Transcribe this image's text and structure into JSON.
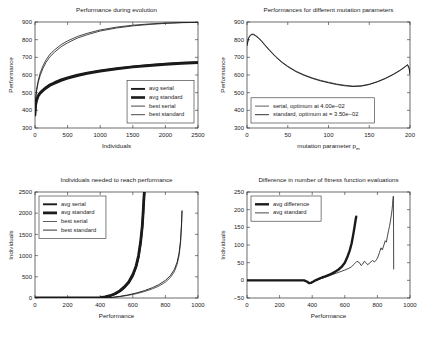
{
  "figure": {
    "background": "#ffffff",
    "line_color": "#1a1a1a",
    "axis_color": "#2b2b2b"
  },
  "chart_data": [
    {
      "id": "performance-during-evolution",
      "type": "line",
      "title": "Performance during evolution",
      "xlabel": "Individuals",
      "ylabel": "Performance",
      "xlim": [
        0,
        2500
      ],
      "ylim": [
        300,
        900
      ],
      "xticks": [
        0,
        500,
        1000,
        1500,
        2000,
        2500
      ],
      "yticks": [
        300,
        400,
        500,
        600,
        700,
        800,
        900
      ],
      "grid": false,
      "legend_position": "lower right",
      "series": [
        {
          "name": "avg serial",
          "width": 1.9,
          "x": [
            0,
            10,
            25,
            50,
            80,
            120,
            170,
            230,
            300,
            400,
            500,
            650,
            800,
            1000,
            1250,
            1500,
            1750,
            2000,
            2250,
            2500
          ],
          "values": [
            375,
            432,
            462,
            487,
            503,
            517,
            532,
            547,
            559,
            575,
            587,
            602,
            613,
            626,
            639,
            649,
            657,
            664,
            669,
            673
          ]
        },
        {
          "name": "avg standard",
          "width": 2.6,
          "x": [
            0,
            10,
            25,
            50,
            80,
            120,
            170,
            230,
            300,
            400,
            500,
            650,
            800,
            1000,
            1250,
            1500,
            1750,
            2000,
            2250,
            2500
          ],
          "values": [
            372,
            427,
            456,
            481,
            497,
            511,
            526,
            541,
            553,
            569,
            581,
            596,
            608,
            621,
            634,
            645,
            653,
            660,
            666,
            670
          ]
        },
        {
          "name": "best serial",
          "width": 0.8,
          "x": [
            0,
            10,
            25,
            50,
            80,
            120,
            170,
            230,
            300,
            400,
            500,
            650,
            800,
            1000,
            1250,
            1500,
            1750,
            2000,
            2250,
            2500
          ],
          "values": [
            380,
            470,
            520,
            570,
            612,
            650,
            686,
            718,
            742,
            772,
            793,
            818,
            836,
            855,
            871,
            882,
            889,
            894,
            897,
            899
          ]
        },
        {
          "name": "best standard",
          "width": 0.8,
          "x": [
            0,
            10,
            25,
            50,
            80,
            120,
            170,
            230,
            300,
            400,
            500,
            650,
            800,
            1000,
            1250,
            1500,
            1750,
            2000,
            2250,
            2500
          ],
          "values": [
            378,
            462,
            510,
            558,
            598,
            636,
            672,
            704,
            729,
            760,
            782,
            809,
            828,
            849,
            866,
            878,
            886,
            892,
            896,
            898
          ]
        }
      ]
    },
    {
      "id": "performances-mutation-parameters",
      "type": "line",
      "title": "Performances for different mutation parameters",
      "xlabel": "mutation parameter p",
      "xlabel_sub": "m",
      "ylabel": "Performance",
      "xlim": [
        0,
        200
      ],
      "ylim": [
        300,
        900
      ],
      "xticks": [
        0,
        50,
        100,
        150,
        200
      ],
      "yticks": [
        300,
        400,
        500,
        600,
        700,
        800,
        900
      ],
      "grid": false,
      "legend_position": "lower left",
      "series": [
        {
          "name": "serial, optimum at 4.00e-02",
          "width": 0.7,
          "x": [
            0,
            2,
            4,
            6,
            8,
            10,
            14,
            18,
            22,
            28,
            35,
            42,
            50,
            60,
            70,
            80,
            90,
            100,
            110,
            120,
            130,
            140,
            150,
            160,
            170,
            180,
            188,
            194,
            197,
            199,
            200
          ],
          "values": [
            770,
            812,
            826,
            832,
            831,
            826,
            812,
            793,
            771,
            740,
            706,
            677,
            650,
            622,
            601,
            584,
            570,
            559,
            549,
            542,
            537,
            539,
            548,
            563,
            582,
            606,
            628,
            648,
            659,
            640,
            608
          ]
        },
        {
          "name": "standard, optimum at = 3.50e-02",
          "width": 0.9,
          "x": [
            0,
            2,
            4,
            6,
            8,
            10,
            14,
            18,
            22,
            28,
            35,
            42,
            50,
            60,
            70,
            80,
            90,
            100,
            110,
            120,
            130,
            140,
            150,
            160,
            170,
            180,
            188,
            194,
            197,
            199,
            200
          ],
          "values": [
            766,
            808,
            823,
            829,
            828,
            823,
            809,
            790,
            768,
            737,
            703,
            674,
            647,
            619,
            598,
            581,
            567,
            556,
            546,
            539,
            535,
            537,
            546,
            561,
            580,
            604,
            626,
            646,
            657,
            636,
            604
          ]
        }
      ]
    },
    {
      "id": "individuals-needed-to-reach-performance",
      "type": "line",
      "title": "Individuals needed to reach performance",
      "xlabel": "Performance",
      "ylabel": "Individuals",
      "xlim": [
        0,
        1000
      ],
      "ylim": [
        0,
        2500
      ],
      "xticks": [
        0,
        200,
        400,
        600,
        800,
        1000
      ],
      "yticks": [
        0,
        500,
        1000,
        1500,
        2000,
        2500
      ],
      "grid": false,
      "legend_position": "upper left",
      "series": [
        {
          "name": "avg serial",
          "width": 1.9,
          "x": [
            0,
            200,
            360,
            400,
            430,
            460,
            490,
            520,
            550,
            575,
            600,
            620,
            635,
            648,
            658,
            664,
            668,
            671
          ],
          "values": [
            0,
            0,
            2,
            8,
            22,
            48,
            90,
            155,
            250,
            355,
            520,
            720,
            960,
            1290,
            1660,
            2020,
            2320,
            2500
          ]
        },
        {
          "name": "avg standard",
          "width": 2.8,
          "x": [
            0,
            200,
            360,
            400,
            430,
            460,
            490,
            520,
            550,
            575,
            600,
            620,
            635,
            648,
            658,
            664,
            668,
            671
          ],
          "values": [
            0,
            0,
            2,
            9,
            25,
            54,
            99,
            168,
            268,
            378,
            548,
            752,
            995,
            1325,
            1695,
            2055,
            2350,
            2500
          ]
        },
        {
          "name": "best serial",
          "width": 0.7,
          "x": [
            0,
            200,
            400,
            440,
            480,
            520,
            570,
            620,
            670,
            720,
            760,
            800,
            830,
            855,
            872,
            884,
            893,
            899,
            902
          ],
          "values": [
            0,
            0,
            1,
            6,
            16,
            32,
            62,
            100,
            150,
            215,
            280,
            375,
            480,
            620,
            790,
            1000,
            1300,
            1700,
            2040
          ]
        },
        {
          "name": "best standard",
          "width": 0.9,
          "x": [
            0,
            200,
            400,
            440,
            480,
            520,
            570,
            620,
            670,
            720,
            760,
            800,
            830,
            855,
            872,
            884,
            893,
            899,
            902
          ],
          "values": [
            0,
            0,
            1,
            7,
            19,
            38,
            72,
            115,
            172,
            243,
            315,
            415,
            525,
            672,
            845,
            1060,
            1360,
            1760,
            2060
          ]
        }
      ]
    },
    {
      "id": "difference-in-fitness-function-evaluations",
      "type": "line",
      "title": "Difference in number of fitness function evaluations",
      "xlabel": "Performance",
      "ylabel": "Individuals",
      "xlim": [
        0,
        1000
      ],
      "ylim": [
        -50,
        250
      ],
      "xticks": [
        0,
        200,
        400,
        600,
        800,
        1000
      ],
      "yticks": [
        -50,
        0,
        50,
        100,
        150,
        200,
        250
      ],
      "grid": false,
      "legend_position": "upper left",
      "series": [
        {
          "name": "avg difference",
          "width": 2.4,
          "x": [
            0,
            200,
            350,
            370,
            380,
            392,
            405,
            420,
            440,
            460,
            480,
            500,
            520,
            540,
            560,
            580,
            600,
            615,
            630,
            642,
            652,
            660,
            666,
            670
          ],
          "values": [
            0,
            0,
            0,
            -4,
            -8,
            -7,
            -4,
            0,
            4,
            8,
            11,
            15,
            19,
            24,
            30,
            38,
            50,
            65,
            84,
            105,
            130,
            152,
            170,
            180
          ]
        },
        {
          "name": "avg standard",
          "width": 0.8,
          "x": [
            0,
            200,
            350,
            370,
            385,
            400,
            420,
            450,
            480,
            510,
            540,
            570,
            600,
            620,
            640,
            660,
            675,
            690,
            700,
            710,
            720,
            730,
            740,
            755,
            770,
            782,
            792,
            800,
            812,
            822,
            830,
            840,
            848,
            855,
            862,
            868,
            874,
            880,
            886,
            890,
            893,
            896,
            898,
            899,
            900
          ],
          "values": [
            0,
            0,
            0,
            -5,
            -7,
            -5,
            -1,
            4,
            9,
            14,
            19,
            24,
            29,
            33,
            38,
            47,
            54,
            50,
            42,
            46,
            54,
            50,
            44,
            50,
            56,
            52,
            57,
            62,
            78,
            92,
            86,
            100,
            112,
            108,
            126,
            140,
            152,
            168,
            186,
            200,
            215,
            232,
            238,
            150,
            32
          ]
        }
      ]
    }
  ]
}
